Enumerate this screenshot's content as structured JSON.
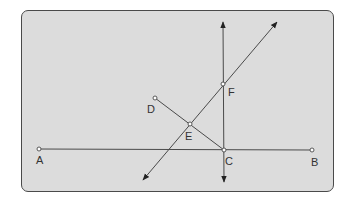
{
  "diagram": {
    "type": "geometry-construction",
    "colors": {
      "background": "#dcdcdc",
      "stroke": "#4a4a4a",
      "label": "#333333",
      "page": "#ffffff"
    },
    "points": [
      {
        "id": "A",
        "label": "A",
        "x": 39,
        "y": 149,
        "lx": 36,
        "ly": 164
      },
      {
        "id": "B",
        "label": "B",
        "x": 312,
        "y": 150,
        "lx": 311,
        "ly": 166
      },
      {
        "id": "C",
        "label": "C",
        "x": 224,
        "y": 150,
        "lx": 225,
        "ly": 165
      },
      {
        "id": "D",
        "label": "D",
        "x": 155,
        "y": 98,
        "lx": 147,
        "ly": 113
      },
      {
        "id": "E",
        "label": "E",
        "x": 190,
        "y": 124,
        "lx": 185,
        "ly": 140
      },
      {
        "id": "F",
        "label": "F",
        "x": 223,
        "y": 84,
        "lx": 228,
        "ly": 96
      }
    ],
    "segments": [
      {
        "name": "segment-AB",
        "from": "A",
        "to": "B"
      },
      {
        "name": "segment-DC",
        "from": "D",
        "to": "C"
      }
    ],
    "lines": [
      {
        "name": "line-through-C-vertical",
        "x1": 223,
        "y1": 22,
        "x2": 224,
        "y2": 182
      },
      {
        "name": "line-through-E-F",
        "x1": 143,
        "y1": 180,
        "x2": 277,
        "y2": 22
      }
    ]
  }
}
